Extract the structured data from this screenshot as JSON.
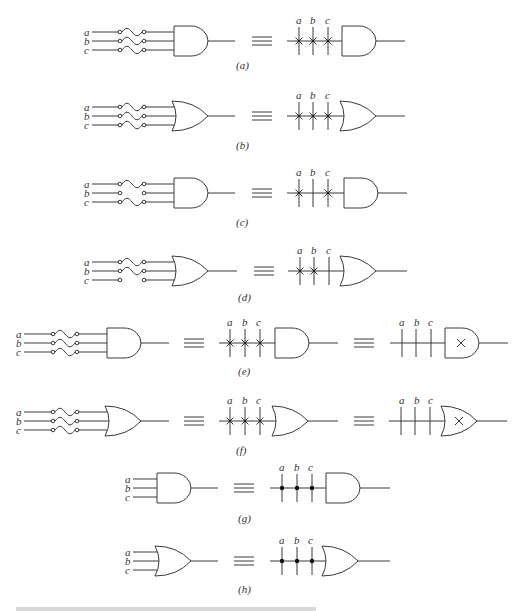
{
  "figure": {
    "inputs": [
      "a",
      "b",
      "c"
    ],
    "equivalence_symbol": "≡",
    "panels": [
      {
        "id": "a",
        "caption": "(a)",
        "gate": "AND",
        "fuses": [
          "intact",
          "intact",
          "intact"
        ],
        "connections": [
          "x",
          "x",
          "x"
        ]
      },
      {
        "id": "b",
        "caption": "(b)",
        "gate": "OR",
        "fuses": [
          "intact",
          "intact",
          "intact"
        ],
        "connections": [
          "x",
          "x",
          "x"
        ]
      },
      {
        "id": "c",
        "caption": "(c)",
        "gate": "AND",
        "fuses": [
          "intact",
          "blown",
          "intact"
        ],
        "connections": [
          "x",
          "none",
          "x"
        ]
      },
      {
        "id": "d",
        "caption": "(d)",
        "gate": "OR",
        "fuses": [
          "intact",
          "intact",
          "blown"
        ],
        "connections": [
          "x",
          "x",
          "none"
        ]
      },
      {
        "id": "e",
        "caption": "(e)",
        "gate": "AND",
        "fuses": [
          "intact",
          "intact",
          "intact"
        ],
        "connections": [
          "x",
          "x",
          "x"
        ],
        "shorthand": "X inside gate"
      },
      {
        "id": "f",
        "caption": "(f)",
        "gate": "OR",
        "fuses": [
          "intact",
          "intact",
          "intact"
        ],
        "connections": [
          "x",
          "x",
          "x"
        ],
        "shorthand": "X inside gate"
      },
      {
        "id": "g",
        "caption": "(g)",
        "gate": "AND",
        "fuses": [],
        "connections": [
          "dot",
          "dot",
          "dot"
        ]
      },
      {
        "id": "h",
        "caption": "(h)",
        "gate": "OR",
        "fuses": [],
        "connections": [
          "dot",
          "dot",
          "dot"
        ]
      }
    ],
    "caption_text": ""
  }
}
